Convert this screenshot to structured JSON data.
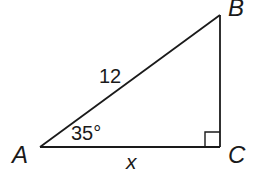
{
  "diagram": {
    "type": "right-triangle",
    "vertices": {
      "A": {
        "label": "A"
      },
      "B": {
        "label": "B"
      },
      "C": {
        "label": "C"
      }
    },
    "sides": {
      "hypotenuse_AB": {
        "label": "12"
      },
      "adjacent_AC": {
        "label": "x"
      }
    },
    "angles": {
      "A": {
        "label": "35°"
      },
      "C": {
        "right_angle": true
      }
    },
    "colors": {
      "stroke": "#1a1a1a",
      "background": "#ffffff"
    }
  }
}
